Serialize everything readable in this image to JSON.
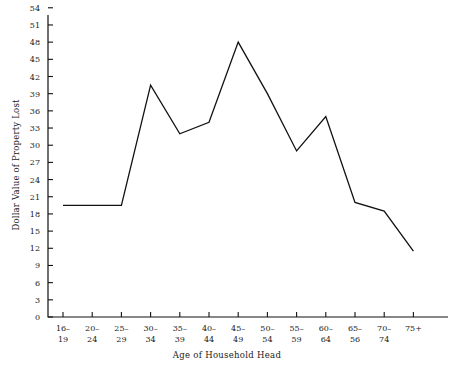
{
  "chart_data": {
    "type": "line",
    "title": "",
    "xlabel": "Age of Household Head",
    "ylabel": "Dollar Value of Property Lost",
    "categories": [
      "16–\n19",
      "20–\n24",
      "25–\n29",
      "30–\n34",
      "35–\n39",
      "40–\n44",
      "45–\n49",
      "50–\n54",
      "55–\n59",
      "60–\n64",
      "65–\n56",
      "70–\n74",
      "75+"
    ],
    "category_lines": [
      [
        "16–",
        "19"
      ],
      [
        "20–",
        "24"
      ],
      [
        "25–",
        "29"
      ],
      [
        "30–",
        "34"
      ],
      [
        "35–",
        "39"
      ],
      [
        "40–",
        "44"
      ],
      [
        "45–",
        "49"
      ],
      [
        "50–",
        "54"
      ],
      [
        "55–",
        "59"
      ],
      [
        "60–",
        "64"
      ],
      [
        "65–",
        "56"
      ],
      [
        "70–",
        "74"
      ],
      [
        "75+",
        ""
      ]
    ],
    "values": [
      19.5,
      19.5,
      19.5,
      40.5,
      32,
      34,
      48,
      39,
      29,
      35,
      20,
      18.5,
      11.5
    ],
    "series": [
      {
        "name": "Dollar Value of Property Lost",
        "values": [
          19.5,
          19.5,
          19.5,
          40.5,
          32,
          34,
          48,
          39,
          29,
          35,
          20,
          18.5,
          11.5
        ]
      }
    ],
    "yticks": [
      0,
      3,
      6,
      9,
      12,
      15,
      18,
      21,
      24,
      27,
      30,
      33,
      36,
      39,
      42,
      45,
      48,
      51,
      54
    ],
    "ylim": [
      0,
      56
    ],
    "xlim": [
      0,
      13
    ],
    "grid": false,
    "legend": false,
    "line_color": "#111111",
    "background_color": "#ffffff"
  }
}
